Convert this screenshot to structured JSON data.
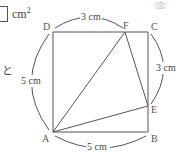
{
  "answer": {
    "unit": "cm",
    "exponent": "2"
  },
  "side_text": "と",
  "header_faint": "（図）",
  "diagram": {
    "points": {
      "A": {
        "label": "A",
        "x": 53,
        "y": 132
      },
      "B": {
        "label": "B",
        "x": 148,
        "y": 132
      },
      "C": {
        "label": "C",
        "x": 148,
        "y": 32
      },
      "D": {
        "label": "D",
        "x": 53,
        "y": 32
      },
      "E": {
        "label": "E",
        "x": 148,
        "y": 106
      },
      "F": {
        "label": "F",
        "x": 125,
        "y": 32
      }
    },
    "dimensions": {
      "DF": "3 cm",
      "CE": "3 cm",
      "AD": "5 cm",
      "AB": "5 cm"
    },
    "colors": {
      "line": "#555555",
      "text": "#444444"
    }
  }
}
